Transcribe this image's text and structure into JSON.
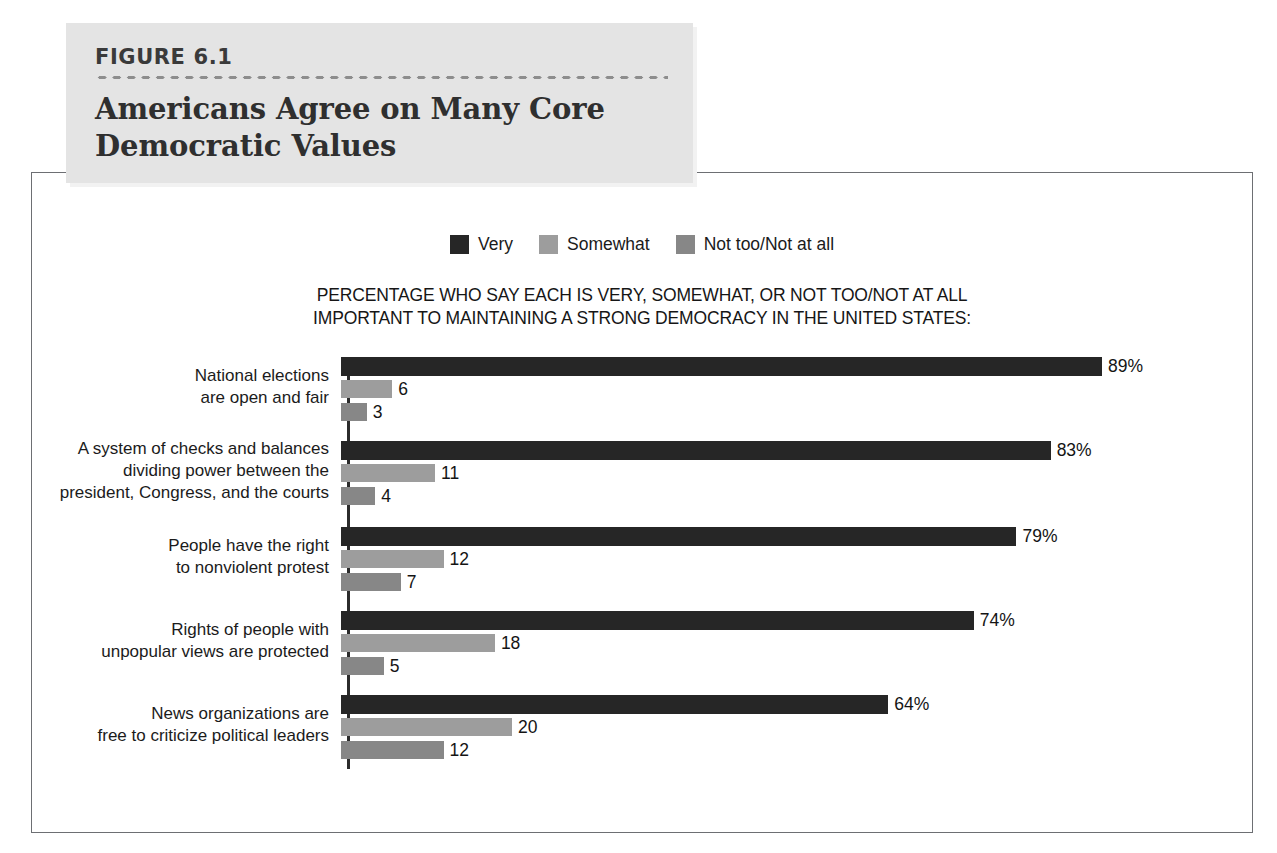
{
  "figure": {
    "number": "FIGURE 6.1",
    "title_line1": "Americans Agree on Many Core",
    "title_line2": "Democratic Values"
  },
  "chart_data": {
    "type": "bar",
    "orientation": "horizontal",
    "title": "Americans Agree on Many Core Democratic Values",
    "subtitle_line1": "PERCENTAGE WHO SAY EACH IS VERY, SOMEWHAT, OR NOT TOO/NOT AT ALL",
    "subtitle_line2": "IMPORTANT TO MAINTAINING A STRONG DEMOCRACY IN THE UNITED STATES:",
    "xlabel": "",
    "ylabel": "",
    "xlim": [
      0,
      100
    ],
    "grid": false,
    "legend_position": "top-center",
    "categories": [
      "National elections are open and fair",
      "A system of checks and balances dividing power between the president, Congress, and the courts",
      "People have the right to nonviolent protest",
      "Rights of people with unpopular views are protected",
      "News organizations are free to criticize political leaders"
    ],
    "series": [
      {
        "name": "Very",
        "color": "#262626",
        "values": [
          89,
          83,
          79,
          74,
          64
        ]
      },
      {
        "name": "Somewhat",
        "color": "#9d9d9d",
        "values": [
          6,
          11,
          12,
          18,
          20
        ]
      },
      {
        "name": "Not too/Not at all",
        "color": "#878787",
        "values": [
          3,
          4,
          7,
          5,
          12
        ]
      }
    ],
    "value_labels": [
      [
        "89%",
        "6",
        "3"
      ],
      [
        "83%",
        "11",
        "4"
      ],
      [
        "79%",
        "12",
        "7"
      ],
      [
        "74%",
        "18",
        "5"
      ],
      [
        "64%",
        "20",
        "12"
      ]
    ]
  },
  "groups": [
    {
      "label_lines": [
        "National elections",
        "are open and fair"
      ],
      "bars": [
        {
          "series": "Very",
          "value": 89,
          "label": "89%"
        },
        {
          "series": "Somewhat",
          "value": 6,
          "label": "6"
        },
        {
          "series": "Not too/Not at all",
          "value": 3,
          "label": "3"
        }
      ]
    },
    {
      "label_lines": [
        "A system of checks and balances",
        "dividing power between the",
        "president, Congress, and the courts"
      ],
      "bars": [
        {
          "series": "Very",
          "value": 83,
          "label": "83%"
        },
        {
          "series": "Somewhat",
          "value": 11,
          "label": "11"
        },
        {
          "series": "Not too/Not at all",
          "value": 4,
          "label": "4"
        }
      ]
    },
    {
      "label_lines": [
        "People have the right",
        "to nonviolent protest"
      ],
      "bars": [
        {
          "series": "Very",
          "value": 79,
          "label": "79%"
        },
        {
          "series": "Somewhat",
          "value": 12,
          "label": "12"
        },
        {
          "series": "Not too/Not at all",
          "value": 7,
          "label": "7"
        }
      ]
    },
    {
      "label_lines": [
        "Rights of people with",
        "unpopular views are protected"
      ],
      "bars": [
        {
          "series": "Very",
          "value": 74,
          "label": "74%"
        },
        {
          "series": "Somewhat",
          "value": 18,
          "label": "18"
        },
        {
          "series": "Not too/Not at all",
          "value": 5,
          "label": "5"
        }
      ]
    },
    {
      "label_lines": [
        "News organizations are",
        "free to criticize political leaders"
      ],
      "bars": [
        {
          "series": "Very",
          "value": 64,
          "label": "64%"
        },
        {
          "series": "Somewhat",
          "value": 20,
          "label": "20"
        },
        {
          "series": "Not too/Not at all",
          "value": 12,
          "label": "12"
        }
      ]
    }
  ],
  "legend": {
    "items": [
      {
        "label": "Very",
        "color": "#262626"
      },
      {
        "label": "Somewhat",
        "color": "#9d9d9d"
      },
      {
        "label": "Not too/Not at all",
        "color": "#878787"
      }
    ]
  }
}
